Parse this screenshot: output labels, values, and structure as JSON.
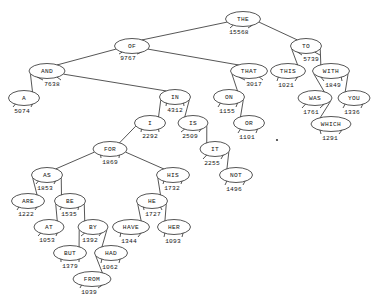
{
  "figure": {
    "kind": "binary-search-tree",
    "node_shape": "ellipse",
    "background_color": "#ffffff",
    "line_color": "#2b2b2b",
    "text_color": "#141414"
  },
  "chart_data": {
    "type": "diagram",
    "title": "",
    "xlabel": "",
    "ylabel": "",
    "layout": "top-down binary tree, counts printed below-right of each node",
    "root": "THE",
    "nodes": [
      {
        "id": "THE",
        "label": "THE",
        "count": "15568",
        "x": 243,
        "y": 19,
        "rx": 17.5,
        "ry": 7.5,
        "count_x": 239,
        "count_y": 32
      },
      {
        "id": "OF",
        "label": "OF",
        "count": "9767",
        "x": 132,
        "y": 46,
        "rx": 17.5,
        "ry": 7.5,
        "count_x": 128,
        "count_y": 58
      },
      {
        "id": "TO",
        "label": "TO",
        "count": "5739",
        "x": 306,
        "y": 46,
        "rx": 15.5,
        "ry": 7.5,
        "count_x": 311,
        "count_y": 59
      },
      {
        "id": "AND",
        "label": "AND",
        "count": "7638",
        "x": 47,
        "y": 71,
        "rx": 18.0,
        "ry": 7.5,
        "count_x": 52,
        "count_y": 84
      },
      {
        "id": "THAT",
        "label": "THAT",
        "count": "3017",
        "x": 249,
        "y": 71,
        "rx": 18.5,
        "ry": 7.5,
        "count_x": 254,
        "count_y": 84
      },
      {
        "id": "THIS",
        "label": "THIS",
        "count": "1021",
        "x": 288,
        "y": 71,
        "rx": 17.5,
        "ry": 7.5,
        "count_x": 286,
        "count_y": 85
      },
      {
        "id": "WITH",
        "label": "WITH",
        "count": "1849",
        "x": 331,
        "y": 71,
        "rx": 18.5,
        "ry": 7.5,
        "count_x": 333,
        "count_y": 85
      },
      {
        "id": "A",
        "label": "A",
        "count": "5074",
        "x": 24,
        "y": 98,
        "rx": 15.5,
        "ry": 7.5,
        "count_x": 22,
        "count_y": 111
      },
      {
        "id": "IN",
        "label": "IN",
        "count": "4312",
        "x": 175,
        "y": 97,
        "rx": 15.5,
        "ry": 7.5,
        "count_x": 175,
        "count_y": 110
      },
      {
        "id": "ON",
        "label": "ON",
        "count": "1155",
        "x": 229,
        "y": 97,
        "rx": 15.5,
        "ry": 7.5,
        "count_x": 227,
        "count_y": 111
      },
      {
        "id": "WAS",
        "label": "WAS",
        "count": "1761",
        "x": 315,
        "y": 98,
        "rx": 17.0,
        "ry": 7.5,
        "count_x": 311,
        "count_y": 112
      },
      {
        "id": "YOU",
        "label": "YOU",
        "count": "1336",
        "x": 354,
        "y": 98,
        "rx": 16.0,
        "ry": 7.5,
        "count_x": 352,
        "count_y": 112
      },
      {
        "id": "I",
        "label": "I",
        "count": "2292",
        "x": 150,
        "y": 123,
        "rx": 15.5,
        "ry": 7.5,
        "count_x": 150,
        "count_y": 136
      },
      {
        "id": "IS",
        "label": "IS",
        "count": "2509",
        "x": 193,
        "y": 123,
        "rx": 15.0,
        "ry": 7.5,
        "count_x": 190,
        "count_y": 136
      },
      {
        "id": "OR",
        "label": "OR",
        "count": "1101",
        "x": 249,
        "y": 123,
        "rx": 15.5,
        "ry": 7.5,
        "count_x": 247,
        "count_y": 137
      },
      {
        "id": "WHICH",
        "label": "WHICH",
        "count": "1291",
        "x": 331,
        "y": 124,
        "rx": 20.0,
        "ry": 7.5,
        "count_x": 330,
        "count_y": 138
      },
      {
        "id": "FOR",
        "label": "FOR",
        "count": "1869",
        "x": 110,
        "y": 149,
        "rx": 17.0,
        "ry": 7.5,
        "count_x": 110,
        "count_y": 162
      },
      {
        "id": "IT",
        "label": "IT",
        "count": "2255",
        "x": 215,
        "y": 149,
        "rx": 15.0,
        "ry": 7.5,
        "count_x": 212,
        "count_y": 163
      },
      {
        "id": "AS",
        "label": "AS",
        "count": "1853",
        "x": 47,
        "y": 175,
        "rx": 15.5,
        "ry": 7.5,
        "count_x": 45,
        "count_y": 188
      },
      {
        "id": "HIS",
        "label": "HIS",
        "count": "1732",
        "x": 173,
        "y": 175,
        "rx": 16.5,
        "ry": 7.5,
        "count_x": 172,
        "count_y": 188
      },
      {
        "id": "NOT",
        "label": "NOT",
        "count": "1496",
        "x": 236,
        "y": 175,
        "rx": 16.5,
        "ry": 7.5,
        "count_x": 234,
        "count_y": 189
      },
      {
        "id": "ARE",
        "label": "ARE",
        "count": "1222",
        "x": 28,
        "y": 201,
        "rx": 16.5,
        "ry": 7.5,
        "count_x": 26,
        "count_y": 214
      },
      {
        "id": "BE",
        "label": "BE",
        "count": "1535",
        "x": 70,
        "y": 201,
        "rx": 15.5,
        "ry": 7.5,
        "count_x": 69,
        "count_y": 214
      },
      {
        "id": "HE",
        "label": "HE",
        "count": "1727",
        "x": 152,
        "y": 201,
        "rx": 15.5,
        "ry": 7.5,
        "count_x": 153,
        "count_y": 214
      },
      {
        "id": "AT",
        "label": "AT",
        "count": "1053",
        "x": 49,
        "y": 227,
        "rx": 15.0,
        "ry": 7.5,
        "count_x": 47,
        "count_y": 240
      },
      {
        "id": "BY",
        "label": "BY",
        "count": "1392",
        "x": 93,
        "y": 227,
        "rx": 15.0,
        "ry": 7.5,
        "count_x": 90,
        "count_y": 240
      },
      {
        "id": "HAVE",
        "label": "HAVE",
        "count": "1344",
        "x": 131,
        "y": 227,
        "rx": 18.5,
        "ry": 7.5,
        "count_x": 129,
        "count_y": 241
      },
      {
        "id": "HER",
        "label": "HER",
        "count": "1093",
        "x": 174,
        "y": 227,
        "rx": 16.5,
        "ry": 7.5,
        "count_x": 173,
        "count_y": 241
      },
      {
        "id": "BUT",
        "label": "BUT",
        "count": "1379",
        "x": 70,
        "y": 253,
        "rx": 16.5,
        "ry": 7.5,
        "count_x": 70,
        "count_y": 266
      },
      {
        "id": "HAD",
        "label": "HAD",
        "count": "1062",
        "x": 111,
        "y": 253,
        "rx": 16.5,
        "ry": 7.5,
        "count_x": 110,
        "count_y": 267
      },
      {
        "id": "FROM",
        "label": "FROM",
        "count": "1039",
        "x": 92,
        "y": 279,
        "rx": 19.0,
        "ry": 7.5,
        "count_x": 89,
        "count_y": 292
      }
    ],
    "edges": [
      {
        "from": "THE",
        "to": "OF",
        "side": "left"
      },
      {
        "from": "THE",
        "to": "TO",
        "side": "right"
      },
      {
        "from": "OF",
        "to": "AND",
        "side": "left"
      },
      {
        "from": "OF",
        "to": "THAT",
        "side": "right"
      },
      {
        "from": "AND",
        "to": "A",
        "side": "left"
      },
      {
        "from": "AND",
        "to": "IN",
        "side": "right"
      },
      {
        "from": "IN",
        "to": "I",
        "side": "left"
      },
      {
        "from": "IN",
        "to": "IS",
        "side": "right"
      },
      {
        "from": "I",
        "to": "FOR",
        "side": "left"
      },
      {
        "from": "FOR",
        "to": "AS",
        "side": "left"
      },
      {
        "from": "FOR",
        "to": "HIS",
        "side": "right"
      },
      {
        "from": "AS",
        "to": "ARE",
        "side": "left"
      },
      {
        "from": "AS",
        "to": "BE",
        "side": "right"
      },
      {
        "from": "BE",
        "to": "AT",
        "side": "left"
      },
      {
        "from": "BE",
        "to": "BY",
        "side": "right"
      },
      {
        "from": "BY",
        "to": "BUT",
        "side": "left"
      },
      {
        "from": "BY",
        "to": "HAD",
        "side": "right"
      },
      {
        "from": "HAD",
        "to": "FROM",
        "side": "left"
      },
      {
        "from": "HIS",
        "to": "HE",
        "side": "left"
      },
      {
        "from": "HE",
        "to": "HAVE",
        "side": "left"
      },
      {
        "from": "HE",
        "to": "HER",
        "side": "right"
      },
      {
        "from": "IS",
        "to": "IT",
        "side": "right"
      },
      {
        "from": "IT",
        "to": "NOT",
        "side": "right"
      },
      {
        "from": "THAT",
        "to": "ON",
        "side": "left"
      },
      {
        "from": "ON",
        "to": "OR",
        "side": "right"
      },
      {
        "from": "TO",
        "to": "THIS",
        "side": "left"
      },
      {
        "from": "TO",
        "to": "WITH",
        "side": "right"
      },
      {
        "from": "WITH",
        "to": "WAS",
        "side": "left"
      },
      {
        "from": "WITH",
        "to": "YOU",
        "side": "right"
      },
      {
        "from": "WAS",
        "to": "WHICH",
        "side": "right"
      }
    ],
    "artifacts": [
      {
        "name": "speck",
        "x": 277,
        "y": 140,
        "r": 1.1
      }
    ]
  }
}
